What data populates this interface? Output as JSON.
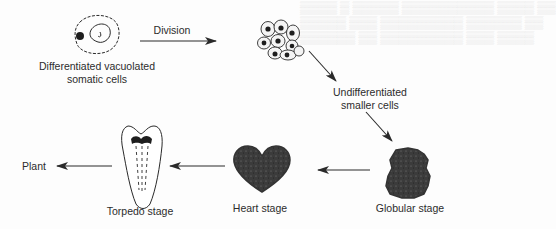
{
  "diagram": {
    "type": "process-flow",
    "nodes": [
      {
        "id": "somatic",
        "label_lines": [
          "Differentiated vacuolated",
          "somatic cells"
        ],
        "icon": "vacuolated-cell-icon"
      },
      {
        "id": "undiff",
        "label_lines": [
          "Undifferentiated",
          "smaller cells"
        ],
        "icon": "cell-cluster-icon"
      },
      {
        "id": "globular",
        "label": "Globular stage",
        "icon": "globular-embryo-icon"
      },
      {
        "id": "heart",
        "label": "Heart stage",
        "icon": "heart-embryo-icon"
      },
      {
        "id": "torpedo",
        "label": "Torpedo stage",
        "icon": "torpedo-embryo-icon"
      },
      {
        "id": "plant",
        "label": "Plant"
      }
    ],
    "edges": [
      {
        "from": "somatic",
        "to": "undiff",
        "label": "Division"
      },
      {
        "from": "undiff",
        "to": "globular",
        "label": ""
      },
      {
        "from": "globular",
        "to": "heart",
        "label": ""
      },
      {
        "from": "heart",
        "to": "torpedo",
        "label": ""
      },
      {
        "from": "torpedo",
        "to": "plant",
        "label": ""
      }
    ]
  },
  "labels": {
    "somatic_line1": "Differentiated vacuolated",
    "somatic_line2": "somatic cells",
    "division": "Division",
    "undiff_line1": "Undifferentiated",
    "undiff_line2": "smaller cells",
    "globular": "Globular stage",
    "heart": "Heart stage",
    "torpedo": "Torpedo stage",
    "plant": "Plant"
  },
  "colors": {
    "ink": "#2a2a2a",
    "paper": "#fdfdfd",
    "bleed_text": "#e3e3e3"
  }
}
